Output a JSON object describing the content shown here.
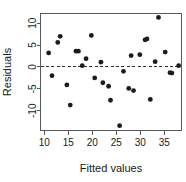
{
  "chart_data": {
    "type": "scatter",
    "title": "",
    "subtitle": "",
    "xlabel": "Fitted values",
    "ylabel": "Residuals",
    "xlim": [
      9.2,
      38.6
    ],
    "ylim": [
      -14.5,
      12.2
    ],
    "xticks": [
      10,
      15,
      20,
      25,
      30,
      35
    ],
    "xticklabels": [
      "10",
      "15",
      "20",
      "25",
      "30",
      "35"
    ],
    "yticks": [
      10,
      5,
      0,
      -5,
      -10
    ],
    "yticklabels": [
      "10",
      "5",
      "0",
      "-5",
      "-10"
    ],
    "grid": false,
    "legend": null,
    "annotations": [
      {
        "kind": "hline",
        "y": 0,
        "style": "dashed",
        "label": "zero residual reference line"
      }
    ],
    "marker": {
      "shape": "circle",
      "size": 2.4,
      "color": "#1b1b1b"
    },
    "points": [
      {
        "x": 10.9,
        "y": 3.2
      },
      {
        "x": 11.6,
        "y": -2.0
      },
      {
        "x": 12.8,
        "y": 5.6
      },
      {
        "x": 13.3,
        "y": 7.0
      },
      {
        "x": 14.7,
        "y": -4.1
      },
      {
        "x": 15.4,
        "y": -8.7
      },
      {
        "x": 16.6,
        "y": 3.6
      },
      {
        "x": 17.1,
        "y": 3.6
      },
      {
        "x": 17.9,
        "y": 0.3
      },
      {
        "x": 18.7,
        "y": 1.9
      },
      {
        "x": 19.8,
        "y": 7.2
      },
      {
        "x": 20.5,
        "y": -2.5
      },
      {
        "x": 21.8,
        "y": 1.1
      },
      {
        "x": 22.2,
        "y": -3.6
      },
      {
        "x": 23.4,
        "y": -4.4
      },
      {
        "x": 23.8,
        "y": -7.6
      },
      {
        "x": 25.7,
        "y": -13.4
      },
      {
        "x": 26.5,
        "y": -1.0
      },
      {
        "x": 27.6,
        "y": -4.9
      },
      {
        "x": 28.1,
        "y": 2.6
      },
      {
        "x": 28.6,
        "y": -5.4
      },
      {
        "x": 29.9,
        "y": 2.8
      },
      {
        "x": 31.0,
        "y": 6.2
      },
      {
        "x": 31.4,
        "y": 6.4
      },
      {
        "x": 32.1,
        "y": -7.4
      },
      {
        "x": 33.1,
        "y": 1.2
      },
      {
        "x": 33.8,
        "y": 11.3
      },
      {
        "x": 35.2,
        "y": 3.4
      },
      {
        "x": 36.2,
        "y": -1.3
      },
      {
        "x": 36.6,
        "y": -1.4
      },
      {
        "x": 38.0,
        "y": 0.3
      }
    ],
    "point_count": 31
  },
  "colors": {
    "background": "#ffffff",
    "axis": "#595959",
    "text": "#1a1a1a",
    "marker": "#1b1b1b",
    "reference_line": "#2b2b2b"
  }
}
